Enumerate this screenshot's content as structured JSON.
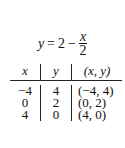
{
  "equation": {
    "lhs": "y",
    "eq": "=",
    "const": "2",
    "minus": "−",
    "numerator": "x",
    "denominator": "2"
  },
  "table": {
    "headers": [
      "x",
      "y",
      "(x, y)"
    ],
    "rows": [
      [
        "−4",
        "4",
        "(−4, 4)"
      ],
      [
        "0",
        "2",
        "(0, 2)"
      ],
      [
        "4",
        "0",
        "(4, 0)"
      ]
    ]
  }
}
